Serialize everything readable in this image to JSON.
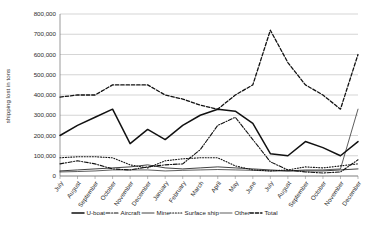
{
  "chart_data": {
    "type": "line",
    "title": "",
    "xlabel": "",
    "ylabel": "shipping lost in tons",
    "ylim": [
      0,
      800000
    ],
    "ytick_labels": [
      "800,000",
      "700,000",
      "600,000",
      "500,000",
      "400,000",
      "300,000",
      "200,000",
      "100,000",
      "0"
    ],
    "ytick_values": [
      800000,
      700000,
      600000,
      500000,
      400000,
      300000,
      200000,
      100000,
      0
    ],
    "grid": true,
    "legend_position": "bottom",
    "categories": [
      "July",
      "August",
      "September",
      "October",
      "November",
      "December",
      "January",
      "February",
      "March",
      "April",
      "May",
      "June",
      "July",
      "August",
      "September",
      "October",
      "November",
      "December"
    ],
    "series": [
      {
        "name": "U-boat",
        "style": "solid-thick",
        "values": [
          200000,
          250000,
          290000,
          330000,
          160000,
          230000,
          180000,
          250000,
          300000,
          330000,
          320000,
          260000,
          110000,
          100000,
          170000,
          140000,
          100000,
          170000
        ]
      },
      {
        "name": "Aircraft",
        "style": "dash-dot",
        "values": [
          60000,
          75000,
          60000,
          35000,
          30000,
          45000,
          55000,
          60000,
          130000,
          250000,
          290000,
          180000,
          70000,
          30000,
          20000,
          15000,
          20000,
          80000
        ]
      },
      {
        "name": "Mine",
        "style": "solid-thin",
        "values": [
          25000,
          30000,
          35000,
          40000,
          45000,
          55000,
          40000,
          35000,
          40000,
          45000,
          40000,
          35000,
          30000,
          25000,
          25000,
          25000,
          30000,
          35000
        ]
      },
      {
        "name": "Surface ship",
        "style": "dotted",
        "values": [
          90000,
          95000,
          95000,
          90000,
          55000,
          40000,
          75000,
          85000,
          90000,
          90000,
          50000,
          30000,
          25000,
          30000,
          45000,
          40000,
          50000,
          60000
        ]
      },
      {
        "name": "Other",
        "style": "solid-thin-light",
        "values": [
          20000,
          22000,
          25000,
          30000,
          30000,
          30000,
          25000,
          28000,
          30000,
          32000,
          30000,
          28000,
          25000,
          25000,
          30000,
          30000,
          35000,
          330000
        ]
      },
      {
        "name": "Total",
        "style": "dashed",
        "values": [
          390000,
          400000,
          400000,
          450000,
          450000,
          450000,
          400000,
          380000,
          350000,
          330000,
          400000,
          450000,
          720000,
          560000,
          450000,
          400000,
          330000,
          600000
        ]
      }
    ],
    "peak_note": "Total peaks at about 720,000 in July (second year)"
  },
  "legend": {
    "items": [
      {
        "label": "U-boat",
        "style": "solid-thick"
      },
      {
        "label": "Aircraft",
        "style": "dash-dot"
      },
      {
        "label": "Mine",
        "style": "solid-thin"
      },
      {
        "label": "Surface ship",
        "style": "dotted"
      },
      {
        "label": "Other",
        "style": "solid-thin-light"
      },
      {
        "label": "Total",
        "style": "dashed"
      }
    ]
  }
}
